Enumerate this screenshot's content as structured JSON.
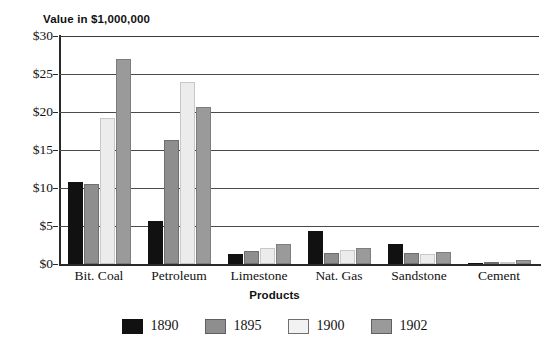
{
  "chart_data": {
    "type": "bar",
    "title": "",
    "xlabel": "Products",
    "ylabel": "Value in $1,000,000",
    "categories": [
      "Bit. Coal",
      "Petroleum",
      "Limestone",
      "Nat. Gas",
      "Sandstone",
      "Cement"
    ],
    "series": [
      {
        "name": "1890",
        "color": "#111111",
        "values": [
          10.8,
          5.6,
          1.3,
          4.3,
          2.6,
          0.1
        ]
      },
      {
        "name": "1895",
        "color": "#8e8e8e",
        "values": [
          10.5,
          16.3,
          1.7,
          1.5,
          1.5,
          0.2
        ]
      },
      {
        "name": "1900",
        "color": "#ececec",
        "values": [
          19.2,
          24.0,
          2.1,
          1.9,
          1.3,
          0.3
        ]
      },
      {
        "name": "1902",
        "color": "#9a9a9a",
        "values": [
          27.0,
          20.7,
          2.6,
          2.1,
          1.6,
          0.5
        ]
      }
    ],
    "ylim": [
      0,
      30
    ],
    "ytick_values": [
      0,
      5,
      10,
      15,
      20,
      25,
      30
    ],
    "ytick_labels": [
      "$0",
      "$5",
      "$10",
      "$15",
      "$20",
      "$25",
      "$30"
    ],
    "grid": true,
    "legend_position": "bottom"
  }
}
